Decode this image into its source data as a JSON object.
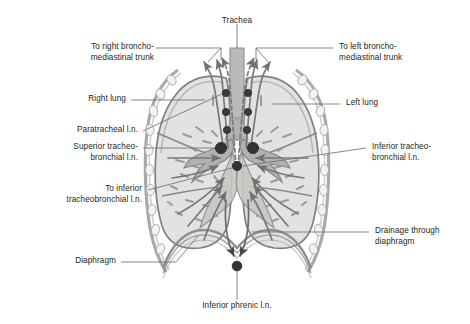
{
  "figure": {
    "type": "anatomical-diagram",
    "view": "anterior coronal section of thorax"
  },
  "colors": {
    "lung_fill": "#e2e3e0",
    "lung_fill_light": "#ecedea",
    "outline": "#8b8d8c",
    "vessel": "#7a7c7b",
    "node_dark": "#3b3b3c",
    "trachea_fill": "#b9bbb8",
    "bronchus_fill": "#b0b2af",
    "text": "#231f20",
    "leader": "#6e7071",
    "background": "#ffffff"
  },
  "labels": {
    "trachea": "Trachea",
    "to_right_bronchomediastinal_trunk": "To right broncho-\nmediastinal trunk",
    "to_left_bronchomediastinal_trunk": "To left broncho-\nmediastinal trunk",
    "right_lung": "Right lung",
    "left_lung": "Left lung",
    "paratracheal_ln": "Paratracheal l.n.",
    "superior_tracheobronchial_ln": "Superior tracheo-\nbronchial l.n.",
    "inferior_tracheobronchial_ln": "Inferior tracheo-\nbronchial l.n.",
    "to_inferior_tracheobronchial_ln": "To inferior\ntracheobronchial l.n.",
    "drainage_through_diaphragm": "Drainage through\ndiaphragm",
    "diaphragm": "Diaphragm",
    "inferior_phrenic_ln": "Inferior phrenic l.n."
  },
  "structures": [
    {
      "name": "trachea",
      "kind": "airway"
    },
    {
      "name": "right-main-bronchus",
      "kind": "airway"
    },
    {
      "name": "left-main-bronchus",
      "kind": "airway"
    },
    {
      "name": "right-lung",
      "kind": "organ"
    },
    {
      "name": "left-lung",
      "kind": "organ"
    },
    {
      "name": "diaphragm",
      "kind": "muscle"
    },
    {
      "name": "rib-cage",
      "kind": "skeletal"
    }
  ],
  "lymph_nodes": [
    {
      "name": "paratracheal-right-1",
      "size": "small"
    },
    {
      "name": "paratracheal-right-2",
      "size": "small"
    },
    {
      "name": "paratracheal-right-3",
      "size": "small"
    },
    {
      "name": "paratracheal-left-1",
      "size": "small"
    },
    {
      "name": "paratracheal-left-2",
      "size": "small"
    },
    {
      "name": "paratracheal-left-3",
      "size": "small"
    },
    {
      "name": "superior-tracheobronchial-right",
      "size": "large"
    },
    {
      "name": "superior-tracheobronchial-left",
      "size": "large"
    },
    {
      "name": "inferior-tracheobronchial",
      "size": "medium"
    },
    {
      "name": "inferior-phrenic",
      "size": "medium"
    }
  ]
}
